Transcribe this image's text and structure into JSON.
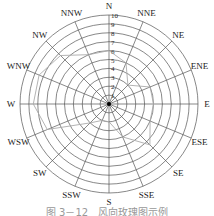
{
  "chart_data": {
    "type": "radar",
    "title": "风向玫瑰图示例",
    "directions": [
      "N",
      "NNE",
      "NE",
      "ENE",
      "E",
      "ESE",
      "SE",
      "SSE",
      "S",
      "SSW",
      "SW",
      "WSW",
      "W",
      "WNW",
      "NW",
      "NNW"
    ],
    "ring_labels": [
      "1",
      "2",
      "3",
      "4",
      "5",
      "6",
      "7",
      "8",
      "9",
      "10"
    ],
    "values": [
      6,
      5,
      3,
      5,
      5,
      5,
      6.5,
      4,
      2,
      2,
      3,
      7.5,
      8.5,
      8.5,
      7.7,
      6
    ],
    "rmax": 10
  },
  "caption": "图 3－12　风向玫瑰图示例",
  "colors": {
    "grid": "#555555",
    "polygon": "#aaaaaa",
    "text": "#222222"
  }
}
